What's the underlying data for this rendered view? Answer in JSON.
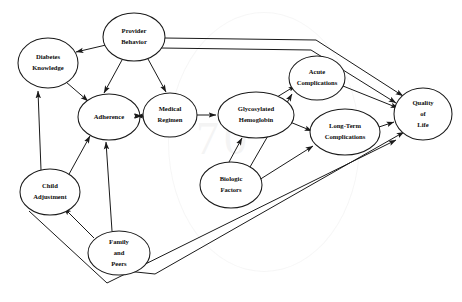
{
  "figure": {
    "kind": "path-diagram",
    "background_color": "#ffffff",
    "line_color": "#1a1a1a",
    "node_fill": "#ffffff"
  },
  "nodes": [
    {
      "id": "provider_behavior",
      "label_lines": [
        "Provider",
        "Behavior"
      ],
      "cx": 134,
      "cy": 37,
      "rx": 31,
      "ry": 24
    },
    {
      "id": "diabetes_knowledge",
      "label_lines": [
        "Diabetes",
        "Knowledge"
      ],
      "cx": 48,
      "cy": 63,
      "rx": 30,
      "ry": 25
    },
    {
      "id": "adherence",
      "label_lines": [
        "Adherence"
      ],
      "cx": 109,
      "cy": 117,
      "rx": 31,
      "ry": 23
    },
    {
      "id": "medical_regimen",
      "label_lines": [
        "Medical",
        "Regimen"
      ],
      "cx": 170,
      "cy": 115,
      "rx": 27,
      "ry": 22
    },
    {
      "id": "glycosylated_hemoglobin",
      "label_lines": [
        "Glycosylated",
        "Hemoglobin"
      ],
      "cx": 256,
      "cy": 115,
      "rx": 38,
      "ry": 23
    },
    {
      "id": "acute_complications",
      "label_lines": [
        "Acute",
        "Complications"
      ],
      "cx": 317,
      "cy": 78,
      "rx": 28,
      "ry": 22
    },
    {
      "id": "long_term_complications",
      "label_lines": [
        "Long-Term",
        "Complications"
      ],
      "cx": 345,
      "cy": 132,
      "rx": 35,
      "ry": 23
    },
    {
      "id": "quality_of_life",
      "label_lines": [
        "Quality",
        "of",
        "Life"
      ],
      "cx": 423,
      "cy": 114,
      "rx": 29,
      "ry": 26
    },
    {
      "id": "biologic_factors",
      "label_lines": [
        "Biologic",
        "Factors"
      ],
      "cx": 231,
      "cy": 185,
      "rx": 31,
      "ry": 23
    },
    {
      "id": "child_adjustment",
      "label_lines": [
        "Child",
        "Adjustment"
      ],
      "cx": 50,
      "cy": 192,
      "rx": 30,
      "ry": 23
    },
    {
      "id": "family_and_peers",
      "label_lines": [
        "Family",
        "and",
        "Peers"
      ],
      "cx": 119,
      "cy": 253,
      "rx": 31,
      "ry": 22
    }
  ],
  "edges": [
    {
      "id": "e1",
      "from": "provider_behavior",
      "to": "diabetes_knowledge",
      "style": "arrow"
    },
    {
      "id": "e2",
      "from": "provider_behavior",
      "to": "adherence",
      "style": "arrow"
    },
    {
      "id": "e3",
      "from": "provider_behavior",
      "to": "medical_regimen",
      "style": "arrow"
    },
    {
      "id": "e4",
      "from": "provider_behavior",
      "to": "quality_of_life",
      "style": "arrow-elbow"
    },
    {
      "id": "e5",
      "from": "provider_behavior",
      "to": "quality_of_life",
      "style": "arrow-elbow"
    },
    {
      "id": "e6",
      "from": "diabetes_knowledge",
      "to": "adherence",
      "style": "arrow"
    },
    {
      "id": "e7",
      "from": "child_adjustment",
      "to": "diabetes_knowledge",
      "style": "arrow"
    },
    {
      "id": "e8",
      "from": "child_adjustment",
      "to": "adherence",
      "style": "arrow"
    },
    {
      "id": "e9",
      "from": "family_and_peers",
      "to": "child_adjustment",
      "style": "arrow"
    },
    {
      "id": "e10",
      "from": "family_and_peers",
      "to": "adherence",
      "style": "arrow"
    },
    {
      "id": "e11",
      "from": "child_adjustment",
      "to": "quality_of_life",
      "style": "arrow-elbow"
    },
    {
      "id": "e12",
      "from": "family_and_peers",
      "to": "quality_of_life",
      "style": "arrow-elbow"
    },
    {
      "id": "e13",
      "from": "adherence",
      "to": "medical_regimen",
      "style": "arrow"
    },
    {
      "id": "e14",
      "from": "medical_regimen",
      "to": "glycosylated_hemoglobin",
      "style": "arrow"
    },
    {
      "id": "e15",
      "from": "glycosylated_hemoglobin",
      "to": "acute_complications",
      "style": "arrow"
    },
    {
      "id": "e16",
      "from": "glycosylated_hemoglobin",
      "to": "long_term_complications",
      "style": "arrow"
    },
    {
      "id": "e17",
      "from": "biologic_factors",
      "to": "glycosylated_hemoglobin",
      "style": "arrow"
    },
    {
      "id": "e18",
      "from": "biologic_factors",
      "to": "acute_complications",
      "style": "arrow"
    },
    {
      "id": "e19",
      "from": "biologic_factors",
      "to": "long_term_complications",
      "style": "arrow"
    },
    {
      "id": "e20",
      "from": "acute_complications",
      "to": "quality_of_life",
      "style": "arrow"
    },
    {
      "id": "e21",
      "from": "long_term_complications",
      "to": "quality_of_life",
      "style": "arrow"
    }
  ],
  "watermark": {
    "text": "70"
  }
}
